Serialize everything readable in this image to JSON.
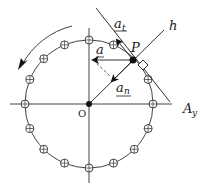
{
  "diagram": {
    "title": "",
    "labels": {
      "origin": "O",
      "point": "P",
      "tangential_accel": "a",
      "tangential_sub": "t",
      "total_accel": "a",
      "normal_accel": "a",
      "normal_sub": "n",
      "line_h": "h",
      "line_ay_main": "A",
      "line_ay_sub": "y"
    },
    "geometry": {
      "center": [
        89,
        104
      ],
      "radius": 64,
      "marker_count": 16,
      "marker_radius": 4,
      "point_angle_deg": 45
    },
    "colors": {
      "stroke": "#333333",
      "background": "#ffffff"
    },
    "notes": {
      "rotation_arrow": "counter-clockwise arc arrow, upper-left",
      "right_angle_marker": "square at P between tangent and line h"
    }
  }
}
